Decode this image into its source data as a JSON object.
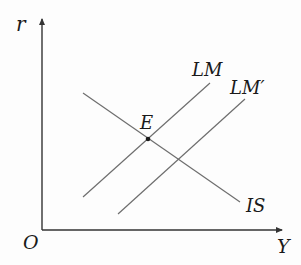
{
  "diagram": {
    "type": "IS-LM model",
    "axes": {
      "y_label": "r",
      "x_label": "Y",
      "origin_label": "O"
    },
    "curves": [
      {
        "id": "IS",
        "label": "IS",
        "slope": "downward"
      },
      {
        "id": "LM",
        "label": "LM",
        "slope": "upward"
      },
      {
        "id": "LM_prime",
        "label": "LM′",
        "slope": "upward"
      }
    ],
    "points": [
      {
        "id": "E",
        "label": "E",
        "description": "intersection of IS and LM"
      }
    ],
    "colors": {
      "axis": "#333333",
      "curve": "#6e6e6e",
      "text": "#1a1a1a",
      "background": "#fdfdfd"
    }
  }
}
